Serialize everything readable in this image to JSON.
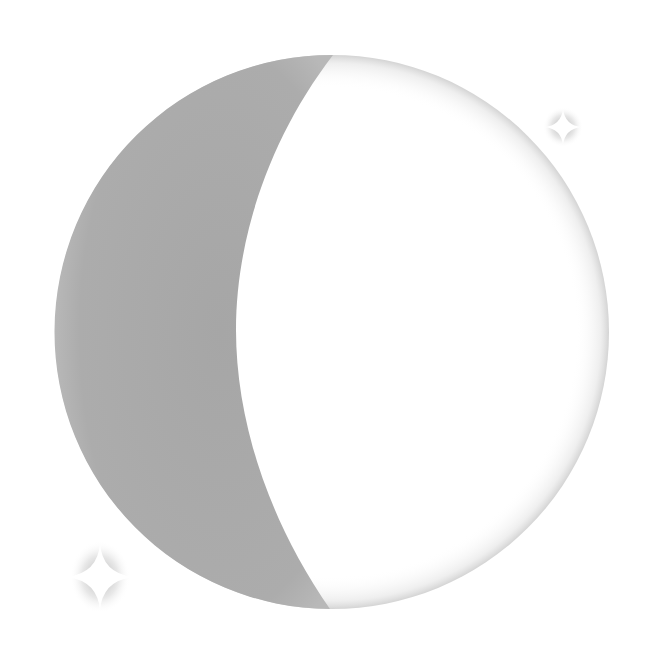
{
  "illustration": {
    "subject": "crescent moon with sparkles",
    "colors": {
      "background": "#ffffff",
      "moon_shadow": "#a9a9a9",
      "moon_lit": "#ffffff",
      "moon_rim": "#d8d8d8",
      "sparkle": "#ffffff",
      "sparkle_glow": "#9a9a9a"
    },
    "moon": {
      "cx": 332,
      "cy": 332,
      "r": 277
    },
    "sparkles": [
      {
        "name": "sparkle-top-right",
        "cx": 563,
        "cy": 127,
        "size": 18
      },
      {
        "name": "sparkle-bottom-left",
        "cx": 100,
        "cy": 577,
        "size": 33
      }
    ]
  }
}
